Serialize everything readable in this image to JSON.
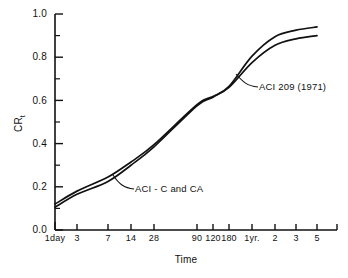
{
  "chart_data": {
    "type": "line",
    "title": "",
    "xlabel": "Time",
    "ylabel": "CR t",
    "ylim": [
      0.0,
      1.0
    ],
    "grid": false,
    "legend_position": "inline-annotations",
    "y_ticks": [
      "0.0",
      "0.2",
      "0.4",
      "0.6",
      "0.8",
      "1.0"
    ],
    "y_tick_values": [
      0.0,
      0.2,
      0.4,
      0.6,
      0.8,
      1.0
    ],
    "y_minor_tick_values": [
      0.1,
      0.3,
      0.5,
      0.7,
      0.9
    ],
    "x_tick_labels": [
      "1day",
      "3",
      "7",
      "14",
      "28",
      "90",
      "120",
      "180",
      "1yr.",
      "2",
      "3",
      "5"
    ],
    "x_tick_days": [
      1,
      3,
      7,
      14,
      28,
      90,
      120,
      180,
      365,
      730,
      1095,
      1825
    ],
    "x_scale": "log",
    "series": [
      {
        "name": "ACI 209 (1971)",
        "x_days": [
          1,
          3,
          7,
          14,
          28,
          90,
          120,
          180,
          365,
          730,
          1095,
          1825
        ],
        "values": [
          0.105,
          0.165,
          0.225,
          0.3,
          0.385,
          0.575,
          0.615,
          0.665,
          0.805,
          0.895,
          0.925,
          0.94
        ]
      },
      {
        "name": "ACI - C and CA",
        "x_days": [
          1,
          3,
          7,
          14,
          28,
          90,
          120,
          180,
          365,
          730,
          1095,
          1825
        ],
        "values": [
          0.12,
          0.18,
          0.245,
          0.315,
          0.395,
          0.58,
          0.618,
          0.66,
          0.775,
          0.855,
          0.885,
          0.9
        ]
      }
    ],
    "annotations": [
      {
        "text": "ACI 209 (1971)",
        "target_series": "ACI 209 (1971)"
      },
      {
        "text": "ACI - C and CA",
        "target_series": "ACI - C and CA"
      }
    ],
    "colors": {
      "line": "#111111",
      "axis": "#111111",
      "background": "#ffffff"
    }
  },
  "axes": {
    "x_title": "Time",
    "y_title": "CR",
    "y_title_subscript": "t"
  },
  "y_tick_labels": {
    "t0": "0.0",
    "t1": "0.2",
    "t2": "0.4",
    "t3": "0.6",
    "t4": "0.8",
    "t5": "1.0"
  },
  "x_tick_labels": {
    "t0": "1day",
    "t1": "3",
    "t2": "7",
    "t3": "14",
    "t4": "28",
    "t5": "90",
    "t6": "120",
    "t7": "180",
    "t8": "1yr.",
    "t9": "2",
    "t10": "3",
    "t11": "5"
  },
  "annotations": {
    "upper": "ACI 209 (1971)",
    "lower": "ACI - C and CA"
  }
}
